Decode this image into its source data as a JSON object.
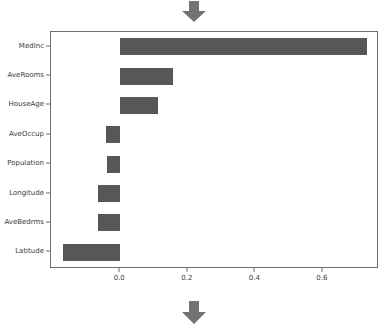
{
  "figure": {
    "background_color": "#ffffff",
    "bar_color": "#575757",
    "axis_color": "#6e6e6e",
    "text_color": "#3b3b3b",
    "top_arrow_icon": "arrow-down-icon",
    "bottom_arrow_icon": "arrow-down-icon",
    "arrow_color": "#737373"
  },
  "chart_data": {
    "type": "bar",
    "orientation": "horizontal",
    "title": "",
    "subtitle": "",
    "xlabel": "",
    "ylabel": "",
    "categories": [
      "MedInc",
      "AveRooms",
      "HouseAge",
      "AveOccup",
      "Population",
      "Longitude",
      "AveBedrms",
      "Latitude"
    ],
    "values": [
      0.73,
      0.156,
      0.112,
      -0.043,
      -0.04,
      -0.065,
      -0.066,
      -0.168
    ],
    "xticks": [
      0.0,
      0.2,
      0.4,
      0.6
    ],
    "xticklabels": [
      "0.0",
      "0.2",
      "0.4",
      "0.6"
    ],
    "xlim": [
      -0.205,
      0.76
    ],
    "grid": false,
    "legend": null,
    "legend_position": "none",
    "annotations": []
  }
}
